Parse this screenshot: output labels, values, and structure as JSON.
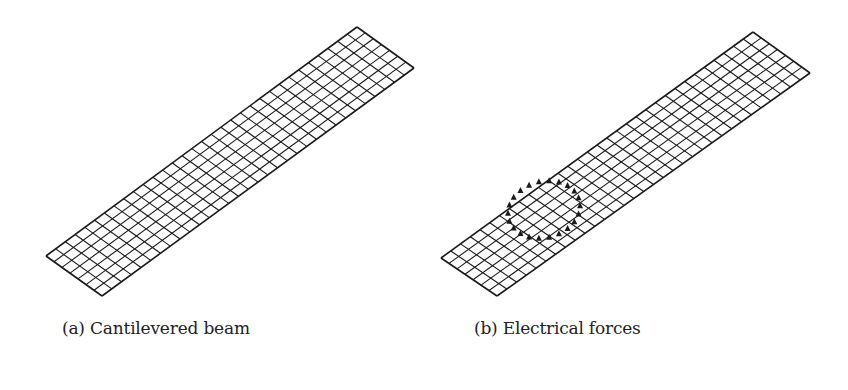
{
  "figure": {
    "panels": [
      {
        "id": "a",
        "caption": "(a) Cantilevered beam",
        "mesh": {
          "corners": {
            "p00": [
              46,
              256
            ],
            "p01": [
              102,
              296
            ],
            "p10": [
              357,
              27
            ],
            "p11": [
              414,
              68
            ]
          },
          "cells_along_length": 32,
          "cells_along_width": 7
        }
      },
      {
        "id": "b",
        "caption": "(b) Electrical forces",
        "mesh": {
          "corners": {
            "p00": [
              441,
              258
            ],
            "p01": [
              497,
              296
            ],
            "p10": [
              753,
              32
            ],
            "p11": [
              810,
              73
            ]
          },
          "cells_along_length": 32,
          "cells_along_width": 7
        },
        "force_ring": {
          "center": [
            544,
            210
          ],
          "rx": 36,
          "ry": 30,
          "markers": 22
        }
      }
    ],
    "colors": {
      "mesh": "#1a1a1a",
      "background": "#ffffff",
      "text": "#222222"
    }
  }
}
